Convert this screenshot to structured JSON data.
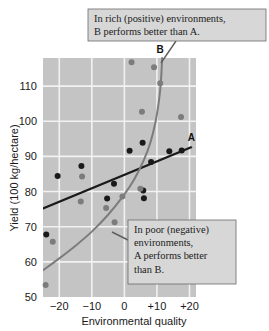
{
  "figure": {
    "name": "genotype-environment-interaction-plot",
    "background": "#ffffff",
    "plot_bg": "#c4c4c4",
    "grid_color": "#f2f2f2"
  },
  "callouts": [
    {
      "id": "rich-environments",
      "lines": [
        "In rich (positive) environments,",
        "B performs better than A."
      ],
      "box": {
        "x": 88,
        "y": 9,
        "w": 178,
        "h": 32
      },
      "leader": {
        "x1": 176,
        "y1": 41,
        "x2": 161,
        "y2": 63
      },
      "leader_color": "#5f5f5f"
    },
    {
      "id": "poor-environments",
      "lines": [
        "In poor (negative)",
        "environments,",
        "A performs better",
        "than B."
      ],
      "box": {
        "x": 128,
        "y": 220,
        "w": 108,
        "h": 64
      },
      "leader": {
        "x1": 128,
        "y1": 240,
        "x2": 112,
        "y2": 232
      },
      "leader_color": "#5f5f5f"
    }
  ],
  "chart_data": {
    "type": "scatter",
    "title": "",
    "xlabel": "Environmental quality",
    "ylabel": "Yield (100 kg/hectare)",
    "xlim": [
      -25,
      22
    ],
    "ylim": [
      50,
      118
    ],
    "xticks": [
      -20,
      -10,
      0,
      10,
      20
    ],
    "xticklabels": [
      "−20",
      "−10",
      "0",
      "+10",
      "+20"
    ],
    "yticks": [
      50,
      60,
      70,
      80,
      90,
      100,
      110
    ],
    "yticklabels": [
      "50",
      "60",
      "70",
      "80",
      "90",
      "100",
      "110"
    ],
    "grid": true,
    "legend": "inline-curve-labels",
    "series": [
      {
        "name": "A",
        "label": "A",
        "color": "#1a1a1a",
        "marker": "circle",
        "fit": "linear",
        "fit_points": [
          [
            -25,
            75.2
          ],
          [
            20.5,
            92.6
          ]
        ],
        "points": [
          [
            -24.0,
            67.8
          ],
          [
            -20.5,
            84.4
          ],
          [
            -13.2,
            87.3
          ],
          [
            -5.3,
            78.0
          ],
          [
            -3.2,
            82.2
          ],
          [
            1.6,
            91.6
          ],
          [
            5.6,
            93.9
          ],
          [
            5.8,
            80.3
          ],
          [
            6.0,
            78.1
          ],
          [
            8.2,
            88.4
          ],
          [
            13.8,
            91.5
          ],
          [
            17.6,
            91.7
          ]
        ]
      },
      {
        "name": "B",
        "label": "B",
        "color": "#7c7c7c",
        "marker": "circle",
        "fit": "exponential",
        "fit_points": [
          [
            -25,
            57.6
          ],
          [
            -20,
            61.0
          ],
          [
            -15,
            64.6
          ],
          [
            -10,
            68.6
          ],
          [
            -5,
            73.4
          ],
          [
            0,
            79.2
          ],
          [
            3,
            83.4
          ],
          [
            6,
            89.0
          ],
          [
            8,
            94.0
          ],
          [
            9.5,
            99.5
          ],
          [
            10.5,
            105.0
          ],
          [
            11.2,
            111.0
          ],
          [
            11.6,
            118.0
          ]
        ],
        "points": [
          [
            -24.2,
            53.4
          ],
          [
            -22.0,
            65.7
          ],
          [
            -13.4,
            77.2
          ],
          [
            -13.0,
            84.3
          ],
          [
            -5.6,
            75.3
          ],
          [
            -3.0,
            71.3
          ],
          [
            -0.6,
            78.6
          ],
          [
            4.9,
            80.8
          ],
          [
            2.2,
            116.8
          ],
          [
            5.4,
            102.7
          ],
          [
            9.1,
            115.4
          ],
          [
            11.0,
            110.8
          ],
          [
            17.4,
            101.2
          ]
        ]
      }
    ],
    "annotations": [
      {
        "text": "A",
        "x": 20.6,
        "y": 94.5
      },
      {
        "text": "B",
        "x": 11.0,
        "y": 119.5
      }
    ]
  }
}
